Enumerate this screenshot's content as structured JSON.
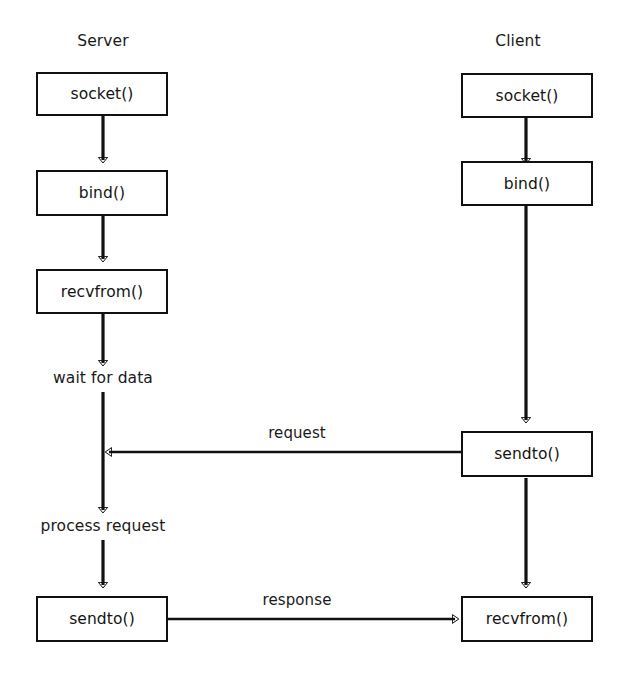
{
  "diagram": {
    "title_server": "Server",
    "title_client": "Client",
    "server_nodes": [
      {
        "label": "socket()",
        "kind": "box"
      },
      {
        "label": "bind()",
        "kind": "box"
      },
      {
        "label": "recvfrom()",
        "kind": "box"
      },
      {
        "label": "wait for data",
        "kind": "text"
      },
      {
        "label": "process request",
        "kind": "text"
      },
      {
        "label": "sendto()",
        "kind": "box"
      }
    ],
    "client_nodes": [
      {
        "label": "socket()",
        "kind": "box"
      },
      {
        "label": "bind()",
        "kind": "box"
      },
      {
        "label": "sendto()",
        "kind": "box"
      },
      {
        "label": "recvfrom()",
        "kind": "box"
      }
    ],
    "edge_labels": {
      "request": "request",
      "response": "response"
    },
    "colors": {
      "stroke": "#111111",
      "text": "#1a1a1a",
      "background": "#ffffff"
    }
  }
}
